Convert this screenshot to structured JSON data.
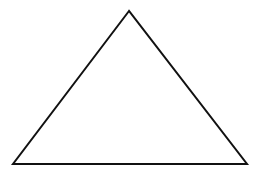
{
  "canvas": {
    "width": 262,
    "height": 181,
    "background": "#ffffff"
  },
  "shapes": [
    {
      "type": "triangle",
      "name": "triangle",
      "vertices": {
        "apex": [
          129,
          11
        ],
        "bottom_left": [
          13,
          164
        ],
        "bottom_right": [
          247,
          164
        ]
      },
      "stroke": "#111111",
      "stroke_width": 2,
      "fill": "none"
    }
  ]
}
